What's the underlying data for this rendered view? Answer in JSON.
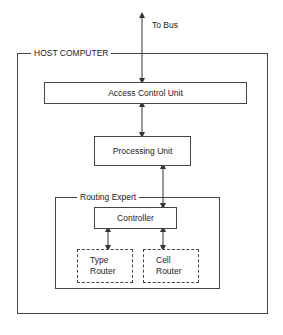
{
  "diagram": {
    "external": {
      "label": "To Bus"
    },
    "host": {
      "label": "HOST COMPUTER",
      "access_control_unit": {
        "label": "Access Control Unit"
      },
      "processing_unit": {
        "label": "Processing Unit"
      },
      "routing_expert": {
        "label": "Routing Expert",
        "controller": {
          "label": "Controller"
        },
        "type_router": {
          "line1": "Type",
          "line2": "Router"
        },
        "cell_router": {
          "line1": "Cell",
          "line2": "Router"
        }
      }
    },
    "connections": [
      {
        "from": "To Bus",
        "to": "Access Control Unit",
        "type": "bidirectional"
      },
      {
        "from": "Access Control Unit",
        "to": "Processing Unit",
        "type": "bidirectional"
      },
      {
        "from": "Processing Unit",
        "to": "Controller",
        "type": "bidirectional"
      },
      {
        "from": "Controller",
        "to": "Type Router",
        "type": "bidirectional"
      },
      {
        "from": "Controller",
        "to": "Cell Router",
        "type": "bidirectional"
      }
    ],
    "colors": {
      "line": "#444444",
      "background": "#ffffff",
      "text": "#222222"
    }
  }
}
